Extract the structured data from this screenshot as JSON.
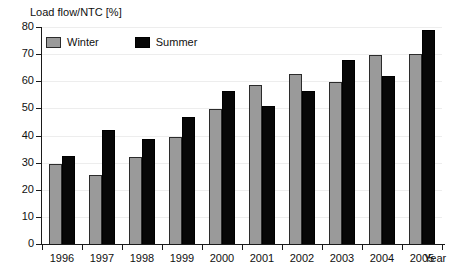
{
  "chart_data": {
    "type": "bar",
    "title": "",
    "ylabel": "Load flow/NTC [%]",
    "xlabel": "Year",
    "ylim": [
      0,
      80
    ],
    "yticks": [
      0,
      10,
      20,
      30,
      40,
      50,
      60,
      70,
      80
    ],
    "grid": true,
    "legend_position": "top-left",
    "categories": [
      "1996",
      "1997",
      "1998",
      "1999",
      "2000",
      "2001",
      "2002",
      "2003",
      "2004",
      "2005"
    ],
    "series": [
      {
        "name": "Winter",
        "color": "#9a9a9a",
        "values": [
          29.5,
          25.3,
          32.0,
          39.5,
          49.6,
          58.8,
          62.8,
          59.8,
          69.8,
          70.0
        ]
      },
      {
        "name": "Summer",
        "color": "#070707",
        "values": [
          32.6,
          42.0,
          38.7,
          47.0,
          56.4,
          51.0,
          56.5,
          68.0,
          61.8,
          79.0
        ]
      }
    ]
  },
  "axes": {
    "y_title": "Load flow/NTC [%]",
    "x_title": "Year",
    "y_tick_labels": [
      "80",
      "70",
      "60",
      "50",
      "40",
      "30",
      "20",
      "10",
      "0"
    ],
    "x_tick_labels": [
      "1996",
      "1997",
      "1998",
      "1999",
      "2000",
      "2001",
      "2002",
      "2003",
      "2004",
      "2005"
    ]
  },
  "legend": {
    "items": [
      {
        "label": "Winter",
        "color": "#9a9a9a"
      },
      {
        "label": "Summer",
        "color": "#070707"
      }
    ]
  }
}
